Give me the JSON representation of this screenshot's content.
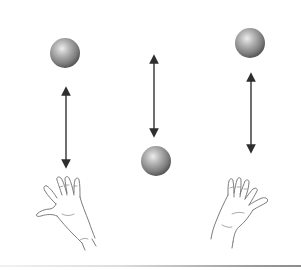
{
  "figure": {
    "colors": {
      "background": "#ffffff",
      "ball_light": "#e6e6e6",
      "ball_mid": "#9a9a9a",
      "ball_dark": "#4a4a4a",
      "arrow": "#3a3a3a",
      "hand_stroke": "#6e6e6e"
    },
    "scenes": [
      {
        "id": "left",
        "ball": {
          "cx": 65,
          "cy": 53,
          "r": 15
        },
        "arrow": {
          "x": 66,
          "y1": 87,
          "y2": 168
        },
        "hand": "left-hand-open"
      },
      {
        "id": "middle",
        "ball": {
          "cx": 156,
          "cy": 161,
          "r": 15
        },
        "arrow": {
          "x": 154,
          "y1": 55,
          "y2": 137
        },
        "hand": "none"
      },
      {
        "id": "right",
        "ball": {
          "cx": 250,
          "cy": 43,
          "r": 15
        },
        "arrow": {
          "x": 251,
          "y1": 73,
          "y2": 153
        },
        "hand": "right-hand-open"
      }
    ]
  }
}
